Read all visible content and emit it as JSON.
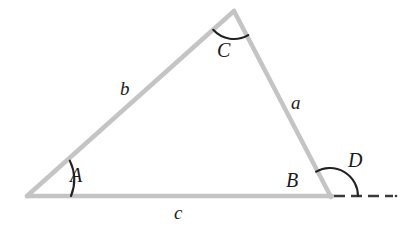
{
  "figure": {
    "type": "geometry-diagram",
    "background_color": "#ffffff",
    "stroke_color_sides": "#c4c4c4",
    "stroke_color_arcs": "#222222",
    "stroke_color_dashed": "#3a3a3a",
    "side_stroke_width": 4,
    "arc_stroke_width": 2,
    "dash_pattern": "10 6"
  },
  "geometry": {
    "vertices": {
      "A": {
        "x": 27,
        "y": 196
      },
      "B": {
        "x": 330,
        "y": 196
      },
      "C": {
        "x": 234,
        "y": 11
      }
    },
    "dashed_extension": {
      "x1": 334,
      "y1": 196,
      "x2": 396,
      "y2": 196
    },
    "arc_A": {
      "cx": 27,
      "cy": 196,
      "radius": 44
    },
    "arc_C": {
      "cx": 234,
      "cy": 11,
      "radius": 28
    },
    "arc_D": {
      "cx": 330,
      "cy": 196,
      "radius": 28
    }
  },
  "labels": {
    "side_a": {
      "text": "a",
      "x": 291,
      "y": 93
    },
    "side_b": {
      "text": "b",
      "x": 120,
      "y": 79
    },
    "side_c": {
      "text": "c",
      "x": 174,
      "y": 203
    },
    "vertex_A": {
      "text": "A",
      "x": 70,
      "y": 165
    },
    "vertex_B": {
      "text": "B",
      "x": 286,
      "y": 170
    },
    "vertex_C": {
      "text": "C",
      "x": 217,
      "y": 40
    },
    "angle_D": {
      "text": "D",
      "x": 348,
      "y": 150
    }
  }
}
